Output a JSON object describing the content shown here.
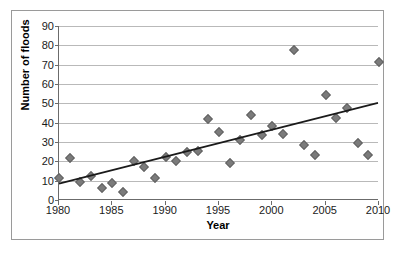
{
  "chart_data": {
    "type": "scatter",
    "title": "",
    "xlabel": "Year",
    "ylabel": "Number of floods",
    "xlim": [
      1980,
      2010
    ],
    "ylim": [
      0,
      90
    ],
    "grid": true,
    "legend": false,
    "x_ticks": [
      1980,
      1985,
      1990,
      1995,
      2000,
      2005,
      2010
    ],
    "y_ticks": [
      0,
      10,
      20,
      30,
      40,
      50,
      60,
      70,
      80,
      90
    ],
    "x_tick_labels": [
      "1980",
      "1985",
      "1990",
      "1995",
      "2000",
      "2005",
      "2010"
    ],
    "y_tick_labels": [
      "0",
      "10",
      "20",
      "30",
      "40",
      "50",
      "60",
      "70",
      "80",
      "90"
    ],
    "marker_color": "#7b7b7b",
    "marker_shape": "diamond",
    "trendline_color": "#1a1a1a",
    "gridline_color": "#b9b9b9",
    "axis_color": "#6b6b6b",
    "x": [
      1980,
      1981,
      1982,
      1983,
      1984,
      1985,
      1986,
      1987,
      1988,
      1989,
      1990,
      1991,
      1992,
      1993,
      1994,
      1995,
      1996,
      1997,
      1998,
      1999,
      2000,
      2001,
      2002,
      2003,
      2004,
      2005,
      2006,
      2007,
      2008,
      2009,
      2010
    ],
    "y": [
      11.5,
      21.5,
      9.5,
      12.5,
      6,
      9,
      4,
      20,
      17,
      11.5,
      22.5,
      20,
      25,
      25.5,
      42,
      35,
      19,
      31,
      44,
      33.5,
      38.5,
      34,
      77.5,
      28.5,
      23.5,
      54.5,
      42.5,
      47.5,
      29.5,
      23.5,
      71.5
    ],
    "trendline": {
      "type": "linear",
      "x_start": 1980,
      "y_start": 8,
      "x_end": 2010,
      "y_end": 50
    }
  }
}
